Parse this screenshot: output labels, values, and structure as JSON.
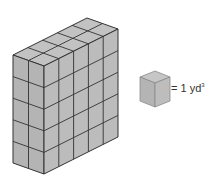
{
  "figure": {
    "prism": {
      "width_cubes": 5,
      "depth_cubes": 2,
      "height_cubes": 5,
      "face_colors": {
        "top": "#c2c2c2",
        "left": "#b4b4b4",
        "right": "#bcbcbc"
      },
      "edge_color": "#333333"
    },
    "unit_cube": {
      "legend_equals": "= 1 yd",
      "legend_exponent": "3",
      "face_colors": {
        "top": "#c6c6c6",
        "left": "#b4b4b4",
        "right": "#bdbdbd"
      },
      "edge_color": "#8a8a8a"
    }
  }
}
